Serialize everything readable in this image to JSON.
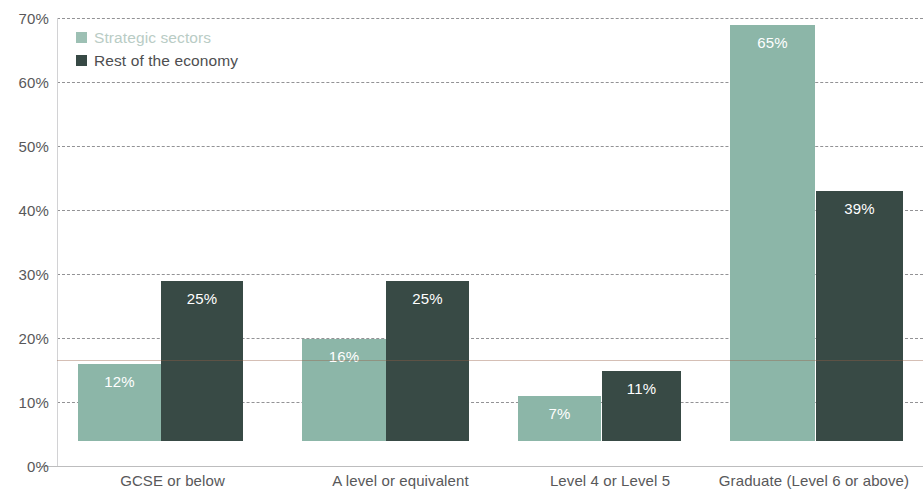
{
  "chart_data": {
    "type": "bar",
    "title": "",
    "xlabel": "",
    "ylabel": "",
    "ylim": [
      0,
      70
    ],
    "ytick_labels": [
      "70%",
      "60%",
      "50%",
      "40%",
      "30%",
      "20%",
      "10%",
      "0%"
    ],
    "ytick_values": [
      70,
      60,
      50,
      40,
      30,
      20,
      10,
      0
    ],
    "grid": true,
    "legend_position": "top-left",
    "categories": [
      "GCSE or below",
      "A level or equivalent",
      "Level 4 or Level 5",
      "Graduate (Level 6 or above)"
    ],
    "series": [
      {
        "name": "Strategic sectors",
        "color": "#8cb6a8",
        "values": [
          12,
          16,
          7,
          65
        ],
        "labels": [
          "12%",
          "16%",
          "7%",
          "65%"
        ]
      },
      {
        "name": "Rest of the economy",
        "color": "#384a45",
        "values": [
          25,
          25,
          11,
          39
        ],
        "labels": [
          "25%",
          "25%",
          "11%",
          "39%"
        ]
      }
    ]
  },
  "legend": {
    "items": [
      {
        "label": "Strategic sectors",
        "color": "#9dc0b4"
      },
      {
        "label": "Rest of the economy",
        "color": "#374945"
      }
    ]
  }
}
